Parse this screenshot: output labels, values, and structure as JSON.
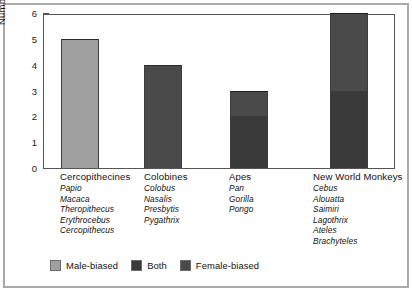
{
  "chart_data": {
    "type": "bar",
    "title": "",
    "xlabel": "",
    "ylabel": "Number of Genera",
    "ylim": [
      0,
      6
    ],
    "yticks": [
      "0",
      "1",
      "2",
      "3",
      "4",
      "5",
      "6"
    ],
    "grid": false,
    "stacked": true,
    "legend_position": "bottom",
    "categories": [
      "Cercopithecines",
      "Colobines",
      "Apes",
      "New World Monkeys"
    ],
    "series": [
      {
        "name": "Male-biased",
        "values": [
          5,
          0,
          0,
          0
        ]
      },
      {
        "name": "Both",
        "values": [
          0,
          0,
          2,
          3
        ]
      },
      {
        "name": "Female-biased",
        "values": [
          0,
          4,
          1,
          3
        ]
      }
    ],
    "totals": [
      5,
      4,
      3,
      6
    ],
    "annotations": {
      "genera_lists": {
        "Cercopithecines": [
          "Papio",
          "Macaca",
          "Theropithecus",
          "Erythrocebus",
          "Cercopithecus"
        ],
        "Colobines": [
          "Colobus",
          "Nasalis",
          "Presbytis",
          "Pygathrix"
        ],
        "Apes": [
          "Pan",
          "Gorilla",
          "Pongo"
        ],
        "New World Monkeys": [
          "Cebus",
          "Alouatta",
          "Saimiri",
          "Lagothrix",
          "Ateles",
          "Brachyteles"
        ]
      }
    }
  },
  "axis": {
    "y_label": "Number of Genera",
    "y_ticks": [
      {
        "label": "6",
        "value": 6
      },
      {
        "label": "5",
        "value": 5
      },
      {
        "label": "4",
        "value": 4
      },
      {
        "label": "3",
        "value": 3
      },
      {
        "label": "2",
        "value": 2
      },
      {
        "label": "1",
        "value": 1
      },
      {
        "label": "0",
        "value": 0
      }
    ]
  },
  "columns": [
    {
      "title": "Cercopithecines",
      "genera": [
        "Papio",
        "Macaca",
        "Theropithecus",
        "Erythrocebus",
        "Cercopithecus"
      ]
    },
    {
      "title": "Colobines",
      "genera": [
        "Colobus",
        "Nasalis",
        "Presbytis",
        "Pygathrix"
      ]
    },
    {
      "title": "Apes",
      "genera": [
        "Pan",
        "Gorilla",
        "Pongo"
      ]
    },
    {
      "title": "New World Monkeys",
      "genera": [
        "Cebus",
        "Alouatta",
        "Saimiri",
        "Lagothrix",
        "Ateles",
        "Brachyteles"
      ]
    }
  ],
  "legend": [
    {
      "label": "Male-biased",
      "color": "#a0a0a0"
    },
    {
      "label": "Both",
      "color": "#3a3a3a"
    },
    {
      "label": "Female-biased",
      "color": "#4a4a4a"
    }
  ],
  "colors": {
    "male_biased": "#a0a0a0",
    "both": "#3a3a3a",
    "female_biased": "#4a4a4a",
    "axis": "#555555",
    "frame": "#a9a9a9",
    "background": "#ffffff",
    "text": "#111111"
  },
  "bars": [
    {
      "category": "Cercopithecines",
      "total": 5,
      "segments": [
        {
          "series": "Male-biased",
          "from": 0,
          "to": 5,
          "color": "#a0a0a0"
        }
      ]
    },
    {
      "category": "Colobines",
      "total": 4,
      "segments": [
        {
          "series": "Female-biased",
          "from": 0,
          "to": 4,
          "color": "#4a4a4a"
        }
      ]
    },
    {
      "category": "Apes",
      "total": 3,
      "segments": [
        {
          "series": "Both",
          "from": 0,
          "to": 2,
          "color": "#3a3a3a"
        },
        {
          "series": "Female-biased",
          "from": 2,
          "to": 3,
          "color": "#4a4a4a"
        }
      ]
    },
    {
      "category": "New World Monkeys",
      "total": 6,
      "segments": [
        {
          "series": "Both",
          "from": 0,
          "to": 3,
          "color": "#3a3a3a"
        },
        {
          "series": "Female-biased",
          "from": 3,
          "to": 6,
          "color": "#4a4a4a"
        }
      ]
    }
  ]
}
